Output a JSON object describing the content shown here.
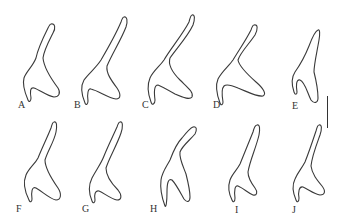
{
  "figure": {
    "type": "specimen-outline-plate",
    "stroke_color": "#3a3a3a",
    "background": "#ffffff",
    "panels": [
      {
        "label": "A",
        "label_x": 18,
        "label_y": 100,
        "path": "M51,24 C55,23 56,28 53,33 C49,41 44,50 43,58 C44,68 52,80 58,88 C61,93 59,97 54,97 C47,96 40,90 34,88 C30,87 30,92 31,98 C31,101 29,103 28,100 C25,93 22,85 24,78 C26,72 33,66 36,58 C38,48 44,36 48,28 C49,26 50,24 51,24 Z"
      },
      {
        "label": "B",
        "label_x": 74,
        "label_y": 100,
        "path": "M124,17 C127,16 128,21 126,27 C121,40 112,54 107,66 C106,73 111,80 117,88 C121,94 121,99 116,99 C108,98 99,91 91,89 C88,88 87,94 88,101 C88,104 86,106 85,103 C82,96 80,87 84,80 C88,74 96,68 101,60 C108,48 116,34 121,22 C122,19 123,17 124,17 Z"
      },
      {
        "label": "C",
        "label_x": 142,
        "label_y": 100,
        "path": "M192,15 C195,14 195,19 193,25 C188,36 177,48 170,58 C168,64 172,72 180,80 C187,87 194,92 192,97 C190,100 184,98 175,94 C168,90 161,86 158,85 C154,85 154,92 155,100 C155,104 152,106 151,102 C148,94 147,85 150,78 C153,71 160,66 164,60 C171,48 183,34 189,22 C190,18 191,15 192,15 Z"
      },
      {
        "label": "D",
        "label_x": 213,
        "label_y": 100,
        "path": "M254,25 C258,24 258,29 255,35 C249,44 240,53 238,60 C239,66 247,74 256,82 C263,88 267,94 263,96 C257,97 248,92 238,88 C231,85 226,84 224,86 C221,89 222,96 223,102 C223,105 221,106 220,103 C217,95 215,86 218,79 C222,71 229,66 233,60 C239,50 246,40 251,30 C252,27 253,25 254,25 Z"
      },
      {
        "label": "E",
        "label_x": 292,
        "label_y": 101,
        "path": "M318,30 C320,29 320,34 319,40 C317,52 314,64 314,72 C316,80 318,90 318,98 C318,103 314,104 311,100 C307,92 305,82 300,80 C296,79 296,86 297,92 C297,95 295,95 294,92 C292,86 291,78 295,72 C300,65 305,56 309,46 C312,38 315,31 318,30 Z"
      },
      {
        "label": "F",
        "label_x": 16,
        "label_y": 204,
        "path": "M54,122 C57,121 57,126 56,132 C54,142 48,150 45,160 C45,168 51,178 58,188 C62,194 61,200 56,200 C50,199 43,192 36,188 C32,186 31,192 32,199 C32,202 30,203 29,200 C25,192 23,182 26,175 C29,168 35,164 38,158 C42,148 47,138 51,128 C52,124 53,122 54,122 Z"
      },
      {
        "label": "G",
        "label_x": 82,
        "label_y": 204,
        "path": "M120,122 C123,121 123,127 121,133 C117,145 109,158 106,168 C106,176 112,184 118,190 C122,195 122,200 117,200 C111,199 104,193 99,191 C95,190 94,195 95,200 C95,203 93,204 92,201 C89,194 88,186 92,178 C96,170 101,164 104,156 C108,146 113,136 117,127 C118,124 119,122 120,122 Z"
      },
      {
        "label": "H",
        "label_x": 150,
        "label_y": 204,
        "path": "M193,127 C197,126 197,130 195,134 C190,140 182,146 180,152 C179,158 183,166 186,174 C188,182 190,190 190,197 C190,202 187,203 184,199 C180,192 176,184 172,180 C168,178 167,184 167,192 C167,202 166,208 165,206 C162,198 160,188 161,180 C162,172 167,166 170,160 C173,152 176,144 182,138 C186,133 190,128 193,127 Z"
      },
      {
        "label": "I",
        "label_x": 235,
        "label_y": 205,
        "path": "M257,125 C260,124 260,129 259,135 C256,148 250,160 248,172 C248,178 252,184 255,188 C258,192 257,196 253,195 C248,193 243,188 238,186 C235,185 234,190 235,198 C235,202 233,203 232,200 C229,194 228,186 230,180 C232,174 237,170 240,164 C244,154 249,142 253,132 C254,128 255,125 257,125 Z"
      },
      {
        "label": "J",
        "label_x": 292,
        "label_y": 205,
        "path": "M319,125 C322,124 322,129 320,135 C316,146 312,156 311,166 C312,174 317,180 322,186 C326,191 325,195 320,195 C314,194 308,189 303,187 C299,186 298,192 299,198 C299,202 297,203 296,200 C293,193 292,185 295,179 C298,172 302,168 305,162 C309,152 313,140 316,131 C317,127 318,125 319,125 Z"
      }
    ],
    "scale_bar": {
      "x": 327,
      "y": 96,
      "length": 32,
      "orientation": "vertical"
    }
  }
}
